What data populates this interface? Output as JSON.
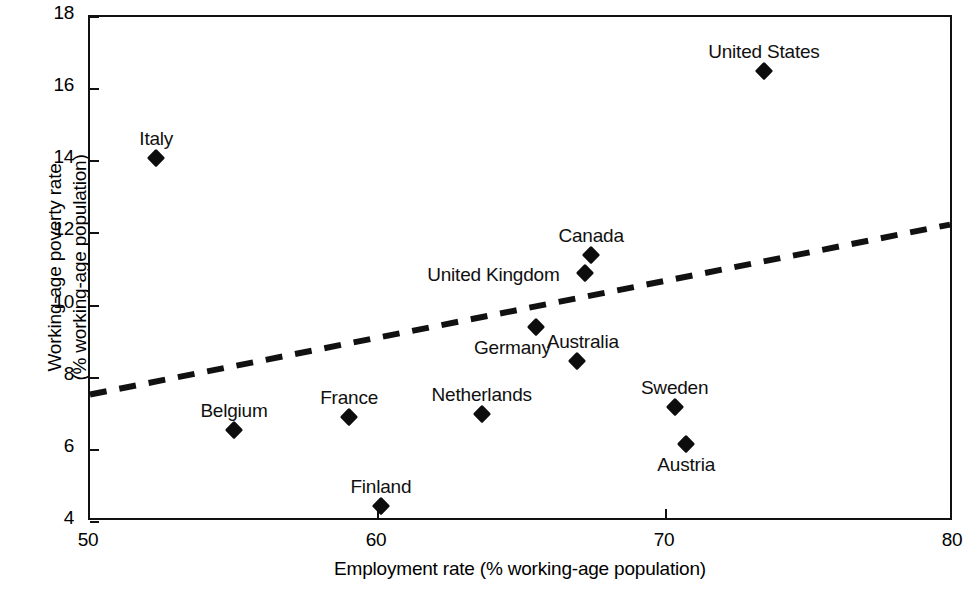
{
  "chart_data": {
    "type": "scatter",
    "title": "",
    "xlabel": "Employment rate (% working-age population)",
    "ylabel": "Working-age poverty rate (% working-age population)",
    "xlim": [
      50,
      80
    ],
    "ylim": [
      4,
      18
    ],
    "xticks": [
      50,
      60,
      70,
      80
    ],
    "yticks": [
      4,
      6,
      8,
      10,
      12,
      14,
      16,
      18
    ],
    "grid": false,
    "legend": "none",
    "points": [
      {
        "label": "Italy",
        "x": 52.3,
        "y": 14.1,
        "label_dx": 0,
        "label_dy": -30
      },
      {
        "label": "United States",
        "x": 73.4,
        "y": 16.5,
        "label_dx": 0,
        "label_dy": -30
      },
      {
        "label": "Canada",
        "x": 67.4,
        "y": 11.4,
        "label_dx": 0,
        "label_dy": -30
      },
      {
        "label": "United Kingdom",
        "x": 67.2,
        "y": 10.9,
        "label_dx": -92,
        "label_dy": -9
      },
      {
        "label": "Germany",
        "x": 65.5,
        "y": 9.4,
        "label_dx": -24,
        "label_dy": 10
      },
      {
        "label": "Australia",
        "x": 66.9,
        "y": 8.45,
        "label_dx": 6,
        "label_dy": -30
      },
      {
        "label": "Netherlands",
        "x": 63.6,
        "y": 7.0,
        "label_dx": 0,
        "label_dy": -30
      },
      {
        "label": "Sweden",
        "x": 70.3,
        "y": 7.2,
        "label_dx": 0,
        "label_dy": -30
      },
      {
        "label": "France",
        "x": 59.0,
        "y": 6.9,
        "label_dx": 0,
        "label_dy": -30
      },
      {
        "label": "Belgium",
        "x": 55.0,
        "y": 6.55,
        "label_dx": 0,
        "label_dy": -30
      },
      {
        "label": "Austria",
        "x": 70.7,
        "y": 6.15,
        "label_dx": 0,
        "label_dy": 10
      },
      {
        "label": "Finland",
        "x": 60.1,
        "y": 4.45,
        "label_dx": 0,
        "label_dy": -30
      }
    ],
    "trendline": {
      "style": "dashed",
      "x0": 50,
      "y0": 7.45,
      "x1": 80,
      "y1": 12.2
    }
  },
  "colors": {
    "marker": "#0d0d0d",
    "axis": "#111111",
    "background": "#ffffff",
    "text": "#101010"
  }
}
